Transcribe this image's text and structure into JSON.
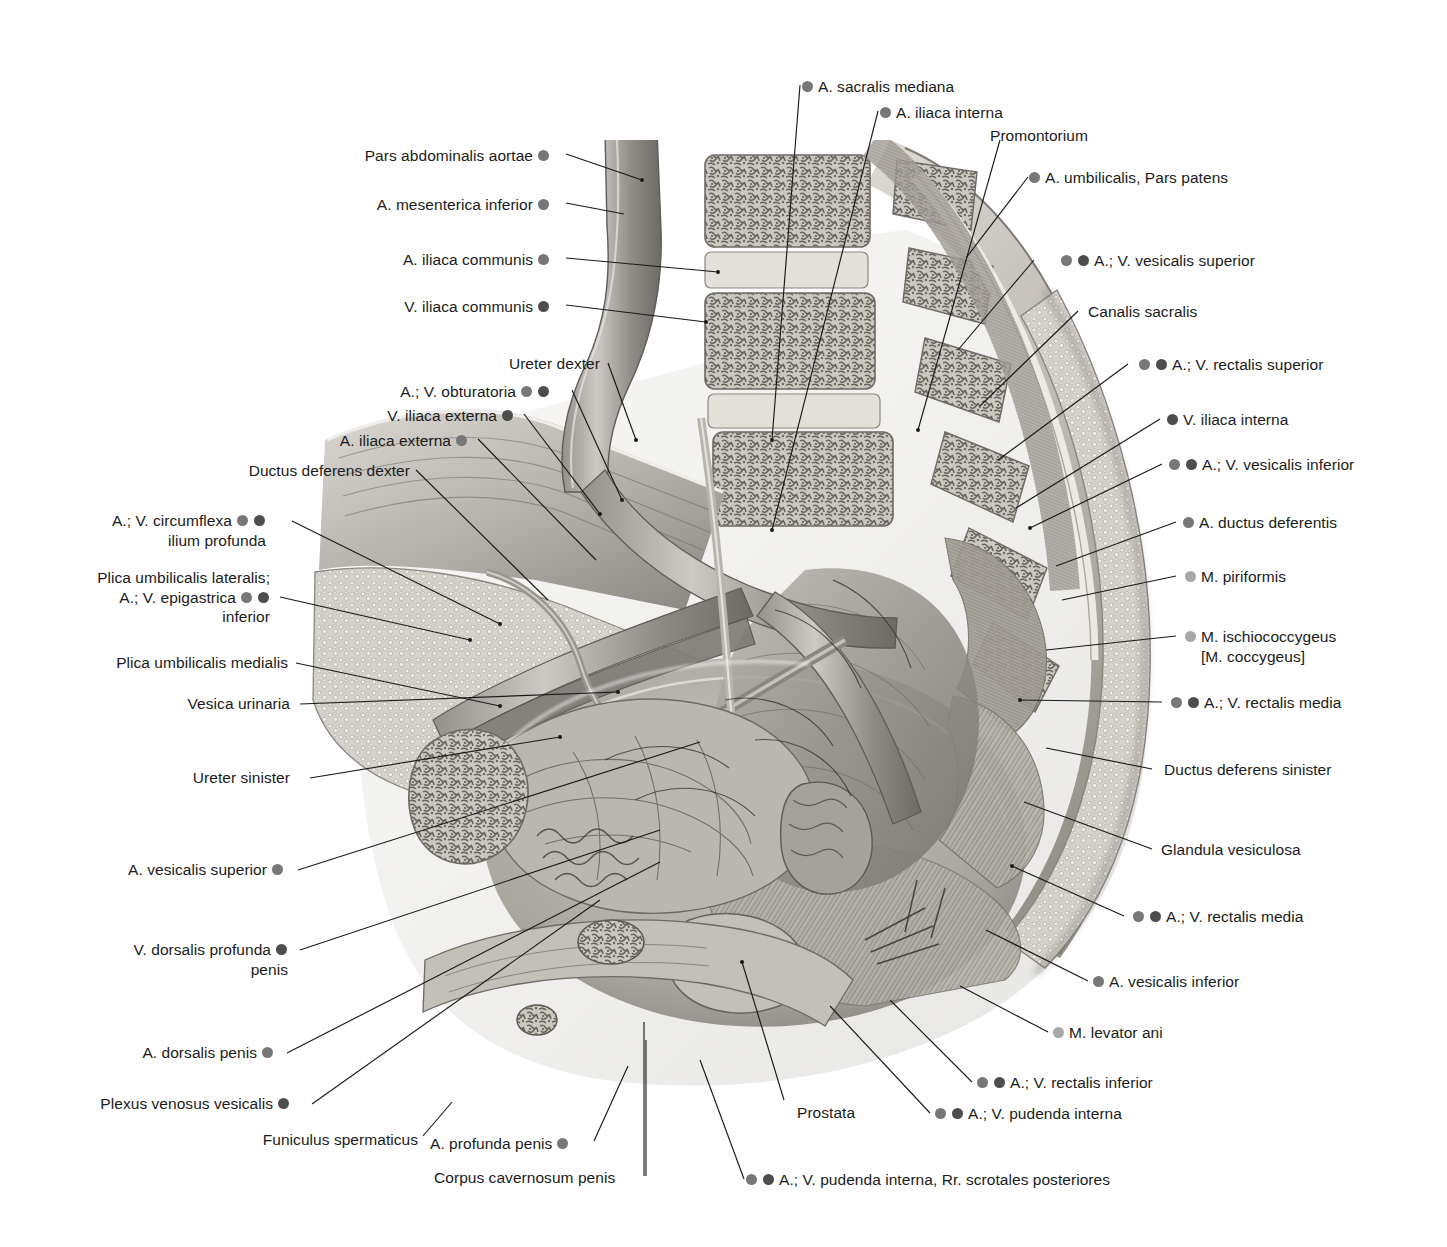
{
  "figure": {
    "colors": {
      "artery_dot": "#777777",
      "vein_dot": "#4d4d4d",
      "muscle_dot": "#a8a8a8",
      "leader_line": "#1a1a1a",
      "text": "#1b1b1b",
      "background": "#ffffff"
    }
  },
  "labels_left": [
    {
      "id": "pars-abdominalis-aortae",
      "text": "Pars abdominalis aortae",
      "dots": [
        "a"
      ]
    },
    {
      "id": "a-mesenterica-inferior",
      "text": "A. mesenterica inferior",
      "dots": [
        "a"
      ]
    },
    {
      "id": "a-iliaca-communis",
      "text": "A. iliaca communis",
      "dots": [
        "a"
      ]
    },
    {
      "id": "v-iliaca-communis",
      "text": "V. iliaca communis",
      "dots": [
        "v"
      ]
    },
    {
      "id": "ureter-dexter",
      "text": "Ureter dexter",
      "dots": []
    },
    {
      "id": "a-v-obturatoria",
      "text": "A.; V. obturatoria",
      "dots": [
        "a",
        "v"
      ]
    },
    {
      "id": "v-iliaca-externa",
      "text": "V. iliaca externa",
      "dots": [
        "v"
      ]
    },
    {
      "id": "a-iliaca-externa",
      "text": "A. iliaca externa",
      "dots": [
        "a"
      ]
    },
    {
      "id": "ductus-deferens-dexter",
      "text": "Ductus deferens dexter",
      "dots": []
    },
    {
      "id": "a-v-circumflexa-ilium-profunda",
      "line1": "A.; V. circumflexa",
      "line2": "ilium profunda",
      "dots": [
        "a",
        "v"
      ]
    },
    {
      "id": "plica-umbilicalis-lateralis",
      "line1": "Plica umbilicalis lateralis;",
      "line2": "A.; V. epigastrica",
      "line3": "inferior",
      "dots": [
        "a",
        "v"
      ]
    },
    {
      "id": "plica-umbilicalis-medialis",
      "text": "Plica umbilicalis medialis",
      "dots": []
    },
    {
      "id": "vesica-urinaria",
      "text": "Vesica urinaria",
      "dots": []
    },
    {
      "id": "ureter-sinister",
      "text": "Ureter sinister",
      "dots": []
    },
    {
      "id": "a-vesicalis-superior",
      "text": "A. vesicalis superior",
      "dots": [
        "a"
      ]
    },
    {
      "id": "v-dorsalis-profunda-penis",
      "line1": "V. dorsalis profunda",
      "line2": "penis",
      "dots": [
        "v"
      ]
    },
    {
      "id": "a-dorsalis-penis",
      "text": "A. dorsalis penis",
      "dots": [
        "a"
      ]
    },
    {
      "id": "plexus-venosus-vesicalis",
      "text": "Plexus venosus vesicalis",
      "dots": [
        "v"
      ]
    },
    {
      "id": "funiculus-spermaticus",
      "text": "Funiculus spermaticus",
      "dots": []
    }
  ],
  "labels_right": [
    {
      "id": "a-sacralis-mediana",
      "text": "A. sacralis mediana",
      "dots": [
        "a"
      ]
    },
    {
      "id": "a-iliaca-interna",
      "text": "A. iliaca interna",
      "dots": [
        "a"
      ]
    },
    {
      "id": "promontorium",
      "text": "Promontorium",
      "dots": []
    },
    {
      "id": "a-umbilicalis-pars-patens",
      "text": "A. umbilicalis, Pars patens",
      "dots": [
        "a"
      ]
    },
    {
      "id": "a-v-vesicalis-superior",
      "text": "A.; V. vesicalis superior",
      "dots": [
        "a",
        "v"
      ]
    },
    {
      "id": "canalis-sacralis",
      "text": "Canalis sacralis",
      "dots": []
    },
    {
      "id": "a-v-rectalis-superior",
      "text": "A.; V. rectalis superior",
      "dots": [
        "a",
        "v"
      ]
    },
    {
      "id": "v-iliaca-interna",
      "text": "V. iliaca interna",
      "dots": [
        "v"
      ]
    },
    {
      "id": "a-v-vesicalis-inferior",
      "text": "A.; V. vesicalis inferior",
      "dots": [
        "a",
        "v"
      ]
    },
    {
      "id": "a-ductus-deferentis",
      "text": "A. ductus deferentis",
      "dots": [
        "a"
      ]
    },
    {
      "id": "m-piriformis",
      "text": "M. piriformis",
      "dots": [
        "m"
      ]
    },
    {
      "id": "m-ischiococcygeus",
      "line1": "M. ischiococcygeus",
      "line2": "[M. coccygeus]",
      "dots": [
        "m"
      ]
    },
    {
      "id": "a-v-rectalis-media-upper",
      "text": "A.; V. rectalis media",
      "dots": [
        "a",
        "v"
      ]
    },
    {
      "id": "ductus-deferens-sinister",
      "text": "Ductus deferens sinister",
      "dots": []
    },
    {
      "id": "glandula-vesiculosa",
      "text": "Glandula vesiculosa",
      "dots": []
    },
    {
      "id": "a-v-rectalis-media-lower",
      "text": "A.; V. rectalis media",
      "dots": [
        "a",
        "v"
      ]
    },
    {
      "id": "a-vesicalis-inferior",
      "text": "A. vesicalis inferior",
      "dots": [
        "a"
      ]
    },
    {
      "id": "m-levator-ani",
      "text": "M. levator ani",
      "dots": [
        "m"
      ]
    },
    {
      "id": "a-v-rectalis-inferior",
      "text": "A.; V. rectalis inferior",
      "dots": [
        "a",
        "v"
      ]
    },
    {
      "id": "a-v-pudenda-interna",
      "text": "A.; V. pudenda interna",
      "dots": [
        "a",
        "v"
      ]
    }
  ],
  "labels_bottom": [
    {
      "id": "prostata",
      "text": "Prostata",
      "dots": []
    },
    {
      "id": "a-profunda-penis",
      "text": "A. profunda penis",
      "dots": [
        "a"
      ]
    },
    {
      "id": "corpus-cavernosum-penis",
      "text": "Corpus cavernosum penis",
      "dots": []
    },
    {
      "id": "a-v-pudenda-interna-rr-scrotales",
      "text": "A.; V. pudenda interna, Rr. scrotales posteriores",
      "dots": [
        "a",
        "v"
      ]
    }
  ]
}
